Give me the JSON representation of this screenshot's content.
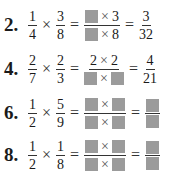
{
  "problems": [
    {
      "number": "2.",
      "a_num": "1",
      "a_den": "4",
      "b_num": "3",
      "b_den": "8",
      "mid_num_left": "",
      "mid_num_right": "3",
      "mid_den_left": "",
      "mid_den_right": "8",
      "res_num": "3",
      "res_den": "32",
      "times": "×",
      "equals": "="
    },
    {
      "number": "4.",
      "a_num": "2",
      "a_den": "7",
      "b_num": "2",
      "b_den": "3",
      "mid_num_left": "2",
      "mid_num_right": "2",
      "mid_den_left": "",
      "mid_den_right": "",
      "res_num": "4",
      "res_den": "21",
      "times": "×",
      "equals": "="
    },
    {
      "number": "6.",
      "a_num": "1",
      "a_den": "2",
      "b_num": "5",
      "b_den": "9",
      "times": "×",
      "equals": "="
    },
    {
      "number": "8.",
      "a_num": "1",
      "a_den": "2",
      "b_num": "1",
      "b_den": "8",
      "times": "×",
      "equals": "="
    }
  ],
  "colors": {
    "blank_box": "#9b9b9b",
    "text": "#1a1a1a"
  }
}
